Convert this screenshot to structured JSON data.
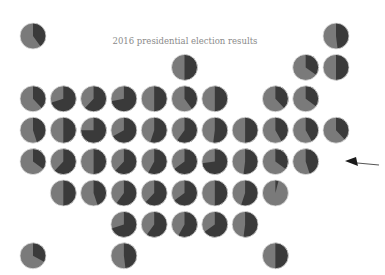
{
  "chart_data": {
    "type": "pie",
    "subtype": "tile-grid-map-of-pies",
    "title": "2016 presidential election results",
    "xlabel": "",
    "ylabel": "",
    "legend": "none",
    "grid": false,
    "series_names": [
      "dark share",
      "light share"
    ],
    "colors": {
      "dark": "#3a3a3a",
      "light": "#7a7a7a",
      "arrow": "#1a1a1a"
    },
    "annotation": {
      "type": "arrow",
      "direction": "left",
      "placement": "right"
    },
    "grid_columns": 11,
    "grid_rows": 8,
    "tiles": [
      {
        "row": 0,
        "col": 0,
        "dark": 0.4
      },
      {
        "row": 0,
        "col": 10,
        "dark": 0.48
      },
      {
        "row": 1,
        "col": 5,
        "dark": 0.5
      },
      {
        "row": 1,
        "col": 9,
        "dark": 0.35
      },
      {
        "row": 1,
        "col": 10,
        "dark": 0.5
      },
      {
        "row": 2,
        "col": 0,
        "dark": 0.38
      },
      {
        "row": 2,
        "col": 1,
        "dark": 0.7
      },
      {
        "row": 2,
        "col": 2,
        "dark": 0.62
      },
      {
        "row": 2,
        "col": 3,
        "dark": 0.72
      },
      {
        "row": 2,
        "col": 4,
        "dark": 0.5
      },
      {
        "row": 2,
        "col": 5,
        "dark": 0.4
      },
      {
        "row": 2,
        "col": 6,
        "dark": 0.5
      },
      {
        "row": 2,
        "col": 8,
        "dark": 0.38
      },
      {
        "row": 2,
        "col": 9,
        "dark": 0.35
      },
      {
        "row": 3,
        "col": 0,
        "dark": 0.45
      },
      {
        "row": 3,
        "col": 1,
        "dark": 0.5
      },
      {
        "row": 3,
        "col": 2,
        "dark": 0.75
      },
      {
        "row": 3,
        "col": 3,
        "dark": 0.67
      },
      {
        "row": 3,
        "col": 4,
        "dark": 0.55
      },
      {
        "row": 3,
        "col": 5,
        "dark": 0.6
      },
      {
        "row": 3,
        "col": 6,
        "dark": 0.52
      },
      {
        "row": 3,
        "col": 7,
        "dark": 0.5
      },
      {
        "row": 3,
        "col": 8,
        "dark": 0.42
      },
      {
        "row": 3,
        "col": 9,
        "dark": 0.42
      },
      {
        "row": 3,
        "col": 10,
        "dark": 0.38
      },
      {
        "row": 4,
        "col": 0,
        "dark": 0.35
      },
      {
        "row": 4,
        "col": 1,
        "dark": 0.62
      },
      {
        "row": 4,
        "col": 2,
        "dark": 0.5
      },
      {
        "row": 4,
        "col": 3,
        "dark": 0.62
      },
      {
        "row": 4,
        "col": 4,
        "dark": 0.58
      },
      {
        "row": 4,
        "col": 5,
        "dark": 0.65
      },
      {
        "row": 4,
        "col": 6,
        "dark": 0.73
      },
      {
        "row": 4,
        "col": 7,
        "dark": 0.52
      },
      {
        "row": 4,
        "col": 8,
        "dark": 0.35
      },
      {
        "row": 4,
        "col": 9,
        "dark": 0.45
      },
      {
        "row": 5,
        "col": 1,
        "dark": 0.5
      },
      {
        "row": 5,
        "col": 2,
        "dark": 0.45
      },
      {
        "row": 5,
        "col": 3,
        "dark": 0.6
      },
      {
        "row": 5,
        "col": 4,
        "dark": 0.62
      },
      {
        "row": 5,
        "col": 5,
        "dark": 0.65
      },
      {
        "row": 5,
        "col": 6,
        "dark": 0.5
      },
      {
        "row": 5,
        "col": 7,
        "dark": 0.55
      },
      {
        "row": 5,
        "col": 8,
        "dark": 0.04
      },
      {
        "row": 6,
        "col": 3,
        "dark": 0.7
      },
      {
        "row": 6,
        "col": 4,
        "dark": 0.6
      },
      {
        "row": 6,
        "col": 5,
        "dark": 0.58
      },
      {
        "row": 6,
        "col": 6,
        "dark": 0.65
      },
      {
        "row": 6,
        "col": 7,
        "dark": 0.52
      },
      {
        "row": 7,
        "col": 0,
        "dark": 0.33
      },
      {
        "row": 7,
        "col": 3,
        "dark": 0.48
      },
      {
        "row": 7,
        "col": 8,
        "dark": 0.5
      }
    ]
  }
}
